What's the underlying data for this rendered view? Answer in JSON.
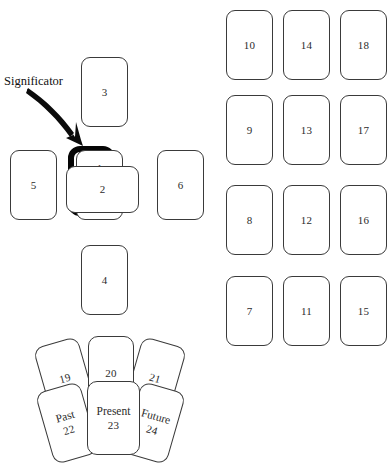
{
  "diagram": {
    "background_color": "#ffffff",
    "card_border_color": "#3a3a3a",
    "significator_color": "#050505"
  },
  "annotation": {
    "significator_label": "Significator",
    "arrow_icon": "arrow-down-right-icon"
  },
  "cross": {
    "cards": [
      {
        "id": "card-1",
        "number": "1",
        "word": ""
      },
      {
        "id": "card-2",
        "number": "2",
        "word": ""
      },
      {
        "id": "card-3",
        "number": "3",
        "word": ""
      },
      {
        "id": "card-4",
        "number": "4",
        "word": ""
      },
      {
        "id": "card-5",
        "number": "5",
        "word": ""
      },
      {
        "id": "card-6",
        "number": "6",
        "word": ""
      }
    ]
  },
  "staff_grid": {
    "columns": [
      {
        "cards": [
          "10",
          "9",
          "8",
          "7"
        ]
      },
      {
        "cards": [
          "14",
          "13",
          "12",
          "11"
        ]
      },
      {
        "cards": [
          "18",
          "17",
          "16",
          "15"
        ]
      }
    ],
    "flat": [
      "10",
      "14",
      "18",
      "9",
      "13",
      "17",
      "8",
      "12",
      "16",
      "7",
      "11",
      "15"
    ]
  },
  "fan": {
    "top_row": [
      {
        "number": "19",
        "word": "",
        "tilt": "left"
      },
      {
        "number": "20",
        "word": "",
        "tilt": "none"
      },
      {
        "number": "21",
        "word": "",
        "tilt": "right"
      }
    ],
    "bottom_row": [
      {
        "number": "22",
        "word": "Past",
        "tilt": "left"
      },
      {
        "number": "23",
        "word": "Present",
        "tilt": "none"
      },
      {
        "number": "24",
        "word": "Future",
        "tilt": "right"
      }
    ]
  }
}
